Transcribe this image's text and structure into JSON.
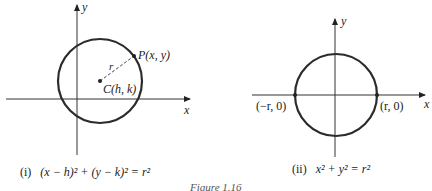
{
  "figure": {
    "title": "Figure 1.16",
    "panels": [
      {
        "id": "i",
        "axis_x_label": "x",
        "axis_y_label": "y",
        "point_label": "P(x, y)",
        "center_label": "C(h, k)",
        "radius_label": "r",
        "caption_number": "(i)",
        "caption_equation": "(x − h)² + (y − k)² = r²"
      },
      {
        "id": "ii",
        "axis_x_label": "x",
        "axis_y_label": "y",
        "left_point_label": "(−r, 0)",
        "right_point_label": "(r, 0)",
        "caption_number": "(ii)",
        "caption_equation": "x² + y² = r²"
      }
    ],
    "colors": {
      "stroke": "#2b2b2b",
      "axis": "#333333",
      "background": "#ffffff"
    }
  }
}
